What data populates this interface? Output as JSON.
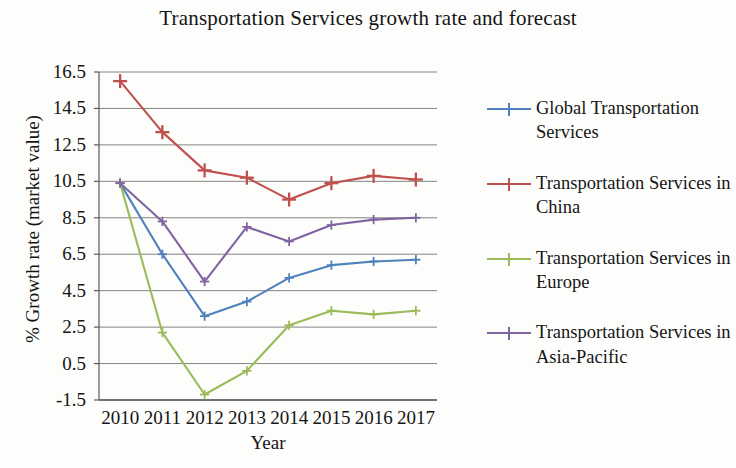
{
  "chart_data": {
    "type": "line",
    "title": "Transportation Services growth rate and forecast",
    "xlabel": "Year",
    "ylabel": "% Growth rate (market value)",
    "categories": [
      "2010",
      "2011",
      "2012",
      "2013",
      "2014",
      "2015",
      "2016",
      "2017"
    ],
    "ylim": [
      -1.5,
      16.5
    ],
    "yticks": [
      "16.5",
      "14.5",
      "12.5",
      "10.5",
      "8.5",
      "6.5",
      "4.5",
      "2.5",
      "0.5",
      "-1.5"
    ],
    "ytick_values": [
      16.5,
      14.5,
      12.5,
      10.5,
      8.5,
      6.5,
      4.5,
      2.5,
      0.5,
      -1.5
    ],
    "grid": true,
    "legend_position": "right",
    "series": [
      {
        "name": "Global Transportation Services",
        "color": "#4f81bd",
        "marker": "plus",
        "values": [
          10.4,
          6.5,
          3.1,
          3.9,
          5.2,
          5.9,
          6.1,
          6.2
        ]
      },
      {
        "name": "Transportation Services in China",
        "color": "#c0504d",
        "marker": "plus",
        "values": [
          16.0,
          13.2,
          11.1,
          10.7,
          9.5,
          10.4,
          10.8,
          10.6
        ]
      },
      {
        "name": "Transportation Services in Europe",
        "color": "#9bbb59",
        "marker": "plus",
        "values": [
          10.4,
          2.2,
          -1.2,
          0.1,
          2.6,
          3.4,
          3.2,
          3.4
        ]
      },
      {
        "name": "Transportation Services in Asia-Pacific",
        "color": "#8064a2",
        "marker": "plus",
        "values": [
          10.4,
          8.3,
          5.0,
          8.0,
          7.2,
          8.1,
          8.4,
          8.5
        ]
      }
    ]
  },
  "axes": {
    "grid_color": "#6f6f6f",
    "axis_color": "#5a5a5a"
  }
}
